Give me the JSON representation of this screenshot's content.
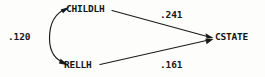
{
  "diagram": {
    "type": "path-diagram",
    "background_color": "#fdfdfc",
    "line_color": "#1a1a1a",
    "text_color": "#141414",
    "nodes": [
      {
        "id": "childlh",
        "label": "CHILDLH",
        "x": 66,
        "y": 3
      },
      {
        "id": "rellh",
        "label": "RELLH",
        "x": 64,
        "y": 59
      },
      {
        "id": "cstate",
        "label": "CSTATE",
        "x": 215,
        "y": 31
      }
    ],
    "paths": [
      {
        "id": "childlh-cstate",
        "from": "childlh",
        "to": "cstate",
        "coefficient": ".241",
        "style": "straight-arrow",
        "label_x": 160,
        "label_y": 9
      },
      {
        "id": "rellh-cstate",
        "from": "rellh",
        "to": "cstate",
        "coefficient": ".161",
        "style": "straight-arrow",
        "label_x": 160,
        "label_y": 59
      },
      {
        "id": "childlh-rellh",
        "from": "childlh",
        "to": "rellh",
        "coefficient": ".120",
        "style": "curved-double-arrow",
        "label_x": 8,
        "label_y": 31
      }
    ]
  }
}
